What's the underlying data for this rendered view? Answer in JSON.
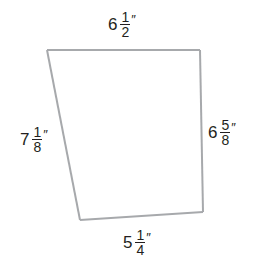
{
  "figure": {
    "shape": "quadrilateral",
    "stroke_color": "#a7a9ac",
    "text_color": "#231f20",
    "sides": {
      "top": {
        "whole": "6",
        "numerator": "1",
        "denominator": "2",
        "unit": "″"
      },
      "right": {
        "whole": "6",
        "numerator": "5",
        "denominator": "8",
        "unit": "″"
      },
      "bottom": {
        "whole": "5",
        "numerator": "1",
        "denominator": "4",
        "unit": "″"
      },
      "left": {
        "whole": "7",
        "numerator": "1",
        "denominator": "8",
        "unit": "″"
      }
    }
  }
}
